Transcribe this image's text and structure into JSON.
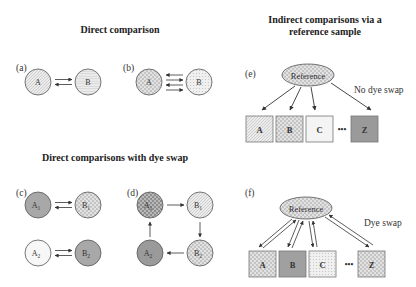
{
  "titles": {
    "direct": "Direct comparison",
    "indirect_line1": "Indirect comparisons via a",
    "indirect_line2": "reference sample",
    "dye_swap": "Direct comparisons with dye swap"
  },
  "panels": {
    "a": {
      "label": "(a)",
      "nodes": [
        "A",
        "B"
      ],
      "arrows": "2 opposite"
    },
    "b": {
      "label": "(b)",
      "nodes": [
        "A",
        "B"
      ],
      "arrows": "4 alternating"
    },
    "c": {
      "label": "(c)",
      "nodes": [
        "A1",
        "B1",
        "A2",
        "B2"
      ]
    },
    "d": {
      "label": "(d)",
      "nodes": [
        "A1",
        "B1",
        "B2",
        "A2"
      ],
      "cycle": "A1→B1→B2→A2→A1"
    },
    "e": {
      "label": "(e)",
      "reference": "Reference",
      "samples": [
        "A",
        "B",
        "C",
        "Z"
      ],
      "ellipsis": "•••",
      "note": "No dye swap"
    },
    "f": {
      "label": "(f)",
      "reference": "Reference",
      "samples": [
        "A",
        "B",
        "C",
        "Z"
      ],
      "ellipsis": "•••",
      "note": "Dye swap"
    }
  },
  "colors": {
    "light_fill": "#ececec",
    "mid_fill": "#c8c8c8",
    "dark_fill": "#9a9a9a",
    "white_fill": "#f7f7f7",
    "stroke": "#555555"
  }
}
